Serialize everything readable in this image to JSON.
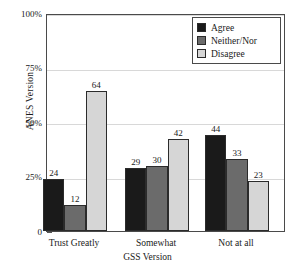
{
  "chart_data": {
    "type": "bar",
    "title": "",
    "subtitle": "",
    "xlabel": "GSS Version",
    "ylabel": "ANES Version",
    "categories": [
      "Trust Greatly",
      "Somewhat",
      "Not at all"
    ],
    "series": [
      {
        "name": "Agree",
        "color": "#1a1a1a",
        "values": [
          24,
          29,
          44
        ]
      },
      {
        "name": "Neither/Nor",
        "color": "#6b6b6b",
        "values": [
          12,
          30,
          33
        ]
      },
      {
        "name": "Disagree",
        "color": "#d6d6d6",
        "values": [
          64,
          42,
          23
        ]
      }
    ],
    "ylim": [
      0,
      100
    ],
    "yticks": [
      "0",
      "25%",
      "50%",
      "75%",
      "100%"
    ],
    "ytick_values": [
      0,
      25,
      50,
      75,
      100
    ],
    "grid": true,
    "legend_position": "top-right",
    "bar_labels": [
      [
        "24",
        "12",
        "64"
      ],
      [
        "29",
        "30",
        "42"
      ],
      [
        "44",
        "33",
        "23"
      ]
    ]
  },
  "axes": {
    "y_title": "ANES Version",
    "x_title": "GSS Version",
    "y_ticks": [
      {
        "label": "100%",
        "value": 100
      },
      {
        "label": "75%",
        "value": 75
      },
      {
        "label": "50%",
        "value": 50
      },
      {
        "label": "25%",
        "value": 25
      },
      {
        "label": "0",
        "value": 0
      }
    ],
    "x_ticks": [
      {
        "label": "Trust Greatly"
      },
      {
        "label": "Somewhat"
      },
      {
        "label": "Not at all"
      }
    ]
  },
  "legend": {
    "items": [
      {
        "label": "Agree",
        "color": "#1a1a1a"
      },
      {
        "label": "Neither/Nor",
        "color": "#6b6b6b"
      },
      {
        "label": "Disagree",
        "color": "#d6d6d6"
      }
    ]
  },
  "colors": {
    "frame": "#4a4a4a",
    "grid": "#d8d8d8",
    "background": "#ffffff",
    "text": "#1a1a1a",
    "bar_border": "#2b2b2b"
  }
}
